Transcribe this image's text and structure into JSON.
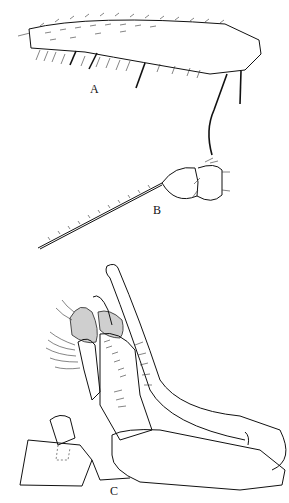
{
  "figure": {
    "panels": [
      {
        "id": "A",
        "label": "A",
        "description": "hind femur with setae"
      },
      {
        "id": "B",
        "label": "B",
        "description": "antennal base with arista"
      },
      {
        "id": "C",
        "label": "C",
        "description": "male genitalia, lateral view"
      }
    ],
    "colors": {
      "ink": "#111111",
      "background": "#ffffff",
      "stipple": "#bbbbbb"
    }
  }
}
